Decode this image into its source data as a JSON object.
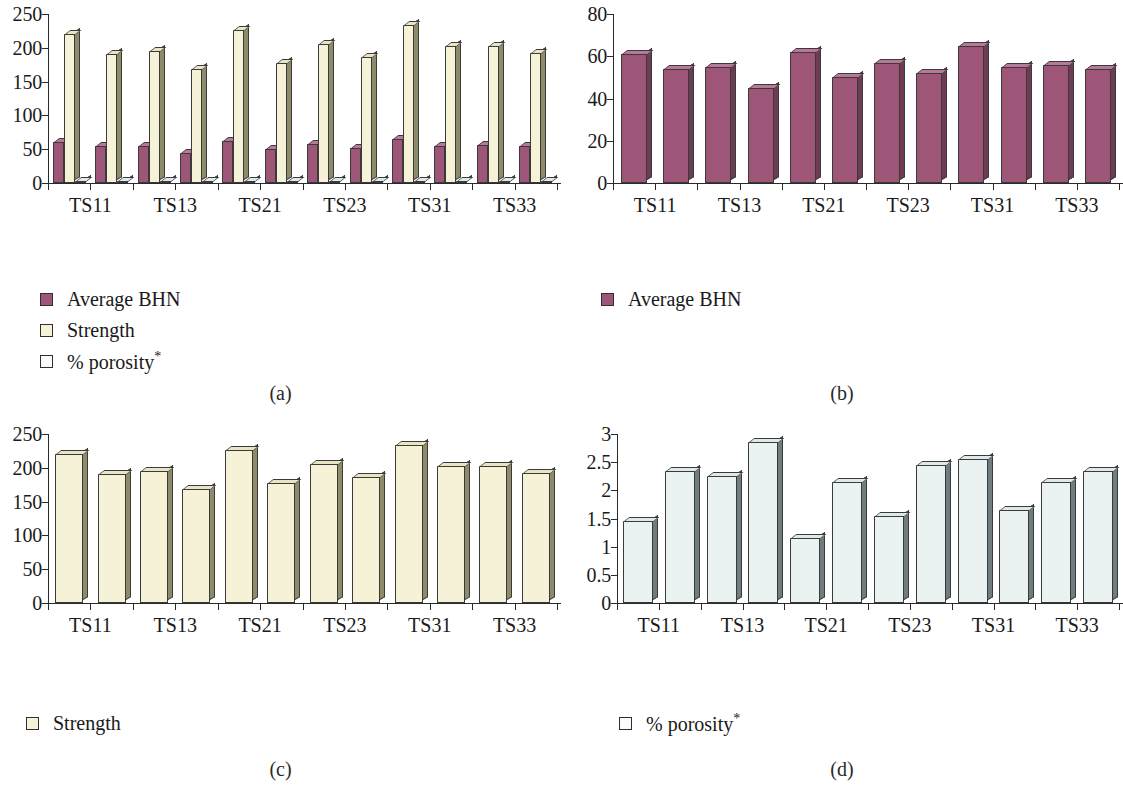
{
  "figure": {
    "categories": [
      "TS11",
      "TS12",
      "TS13",
      "TS14",
      "TS21",
      "TS22",
      "TS23",
      "TS24",
      "TS31",
      "TS32",
      "TS33",
      "TS34"
    ],
    "visible_tick_labels": [
      "TS11",
      "TS13",
      "TS21",
      "TS23",
      "TS31",
      "TS33"
    ],
    "colors": {
      "bhn": "#9d5578",
      "strength": "#f5f2d8",
      "porosity": "#eaf2f2",
      "axis": "#2a2a2a",
      "outline": "#3a3a3a"
    }
  },
  "panels": [
    {
      "id": "a",
      "caption": "(a)",
      "legend": [
        {
          "label": "Average BHN",
          "series": "bhn"
        },
        {
          "label": "Strength",
          "series": "strength"
        },
        {
          "label": "% porosity",
          "series": "porosity",
          "superscript": "*"
        }
      ]
    },
    {
      "id": "b",
      "caption": "(b)",
      "legend": [
        {
          "label": "Average BHN",
          "series": "bhn"
        }
      ]
    },
    {
      "id": "c",
      "caption": "(c)",
      "legend": [
        {
          "label": "Strength",
          "series": "strength"
        }
      ]
    },
    {
      "id": "d",
      "caption": "(d)",
      "legend": [
        {
          "label": "% porosity",
          "series": "porosity",
          "superscript": "*"
        }
      ]
    }
  ],
  "chart_data": [
    {
      "panel": "a",
      "type": "bar",
      "title": "",
      "xlabel": "",
      "ylabel": "",
      "categories": [
        "TS11",
        "TS12",
        "TS13",
        "TS14",
        "TS21",
        "TS22",
        "TS23",
        "TS24",
        "TS31",
        "TS32",
        "TS33",
        "TS34"
      ],
      "ylim": [
        0,
        250
      ],
      "yticks": [
        0,
        50,
        100,
        150,
        200,
        250
      ],
      "grid": false,
      "legend_position": "below-left",
      "series": [
        {
          "name": "Average BHN",
          "values": [
            61,
            54,
            55,
            45,
            62,
            50,
            57,
            52,
            65,
            55,
            56,
            54
          ]
        },
        {
          "name": "Strength",
          "values": [
            220,
            191,
            196,
            168,
            226,
            177,
            205,
            187,
            234,
            202,
            203,
            193
          ]
        },
        {
          "name": "% porosity*",
          "values": [
            1.45,
            2.35,
            2.25,
            2.85,
            1.15,
            2.15,
            1.55,
            2.45,
            2.55,
            1.65,
            2.15,
            2.35
          ]
        }
      ]
    },
    {
      "panel": "b",
      "type": "bar",
      "title": "",
      "xlabel": "",
      "ylabel": "",
      "categories": [
        "TS11",
        "TS12",
        "TS13",
        "TS14",
        "TS21",
        "TS22",
        "TS23",
        "TS24",
        "TS31",
        "TS32",
        "TS33",
        "TS34"
      ],
      "ylim": [
        0,
        80
      ],
      "yticks": [
        0,
        20,
        40,
        60,
        80
      ],
      "grid": false,
      "legend_position": "below-left",
      "series": [
        {
          "name": "Average BHN",
          "values": [
            61,
            54,
            55,
            45,
            62,
            50,
            57,
            52,
            65,
            55,
            56,
            54
          ]
        }
      ]
    },
    {
      "panel": "c",
      "type": "bar",
      "title": "",
      "xlabel": "",
      "ylabel": "",
      "categories": [
        "TS11",
        "TS12",
        "TS13",
        "TS14",
        "TS21",
        "TS22",
        "TS23",
        "TS24",
        "TS31",
        "TS32",
        "TS33",
        "TS34"
      ],
      "ylim": [
        0,
        250
      ],
      "yticks": [
        0,
        50,
        100,
        150,
        200,
        250
      ],
      "grid": false,
      "legend_position": "below-left",
      "series": [
        {
          "name": "Strength",
          "values": [
            220,
            191,
            196,
            168,
            226,
            177,
            205,
            187,
            234,
            202,
            203,
            193
          ]
        }
      ]
    },
    {
      "panel": "d",
      "type": "bar",
      "title": "",
      "xlabel": "",
      "ylabel": "",
      "categories": [
        "TS11",
        "TS12",
        "TS13",
        "TS14",
        "TS21",
        "TS22",
        "TS23",
        "TS24",
        "TS31",
        "TS32",
        "TS33",
        "TS34"
      ],
      "ylim": [
        0,
        3
      ],
      "yticks": [
        0,
        0.5,
        1,
        1.5,
        2,
        2.5,
        3
      ],
      "ytick_labels": [
        "0",
        "0.5",
        "1",
        "1.5",
        "2",
        "2.5",
        "3"
      ],
      "grid": false,
      "legend_position": "below-left",
      "series": [
        {
          "name": "% porosity*",
          "values": [
            1.45,
            2.35,
            2.25,
            2.85,
            1.15,
            2.15,
            1.55,
            2.45,
            2.55,
            1.65,
            2.15,
            2.35
          ]
        }
      ]
    }
  ]
}
